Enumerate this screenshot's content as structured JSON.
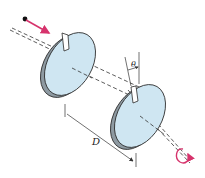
{
  "diagram": {
    "labels": {
      "theta": "θ",
      "distance": "D"
    },
    "colors": {
      "disk_fill": "#cfe6f2",
      "disk_edge": "#9aa8b0",
      "outline": "#2a2a2a",
      "particle_arrow": "#d6336c",
      "rotation_arrow": "#d6336c",
      "axis_dash": "#333333"
    },
    "elements": [
      {
        "id": "particle",
        "type": "dot"
      },
      {
        "id": "velocity-arrow",
        "type": "arrow"
      },
      {
        "id": "disk-1",
        "type": "slotted-disk"
      },
      {
        "id": "disk-2",
        "type": "slotted-disk"
      },
      {
        "id": "axis",
        "type": "dashed-line"
      },
      {
        "id": "distance-dimension",
        "label": "D"
      },
      {
        "id": "angle-dimension",
        "label": "θ"
      },
      {
        "id": "rotation-indicator",
        "type": "curved-arrow"
      }
    ]
  }
}
